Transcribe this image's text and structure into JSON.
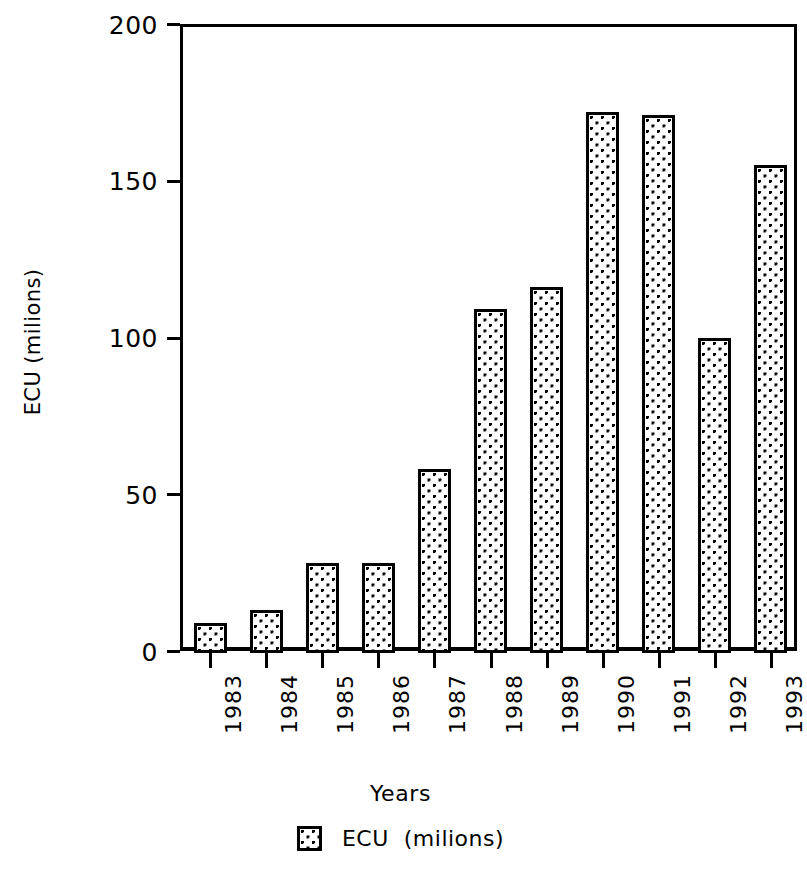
{
  "chart_data": {
    "type": "bar",
    "title": "",
    "subtitle": "",
    "xlabel": "Years",
    "ylabel": "ECU  (milions)",
    "categories": [
      "1983",
      "1984",
      "1985",
      "1986",
      "1987",
      "1988",
      "1989",
      "1990",
      "1991",
      "1992",
      "1993"
    ],
    "values": [
      9,
      13,
      28,
      28,
      58,
      109,
      116,
      172,
      171,
      100,
      155
    ],
    "series": [
      {
        "name": "ECU  (milions)",
        "values": [
          9,
          13,
          28,
          28,
          58,
          109,
          116,
          172,
          171,
          100,
          155
        ]
      }
    ],
    "ylim": [
      0,
      200
    ],
    "yticks": [
      0,
      50,
      100,
      150,
      200
    ],
    "ytick_labels": [
      "0",
      "50",
      "100",
      "150",
      "200"
    ],
    "grid": false,
    "legend": {
      "position": "bottom-center",
      "entries": [
        {
          "label": "ECU  (milions)",
          "swatch": "dotted-pattern-swatch"
        }
      ]
    },
    "bar_style": {
      "fill": "#ffffff",
      "pattern": "dots",
      "edge_color": "#000000"
    },
    "xtick_rotation": 90
  },
  "axis": {
    "y_title": "ECU  (milions)",
    "x_title": "Years"
  }
}
